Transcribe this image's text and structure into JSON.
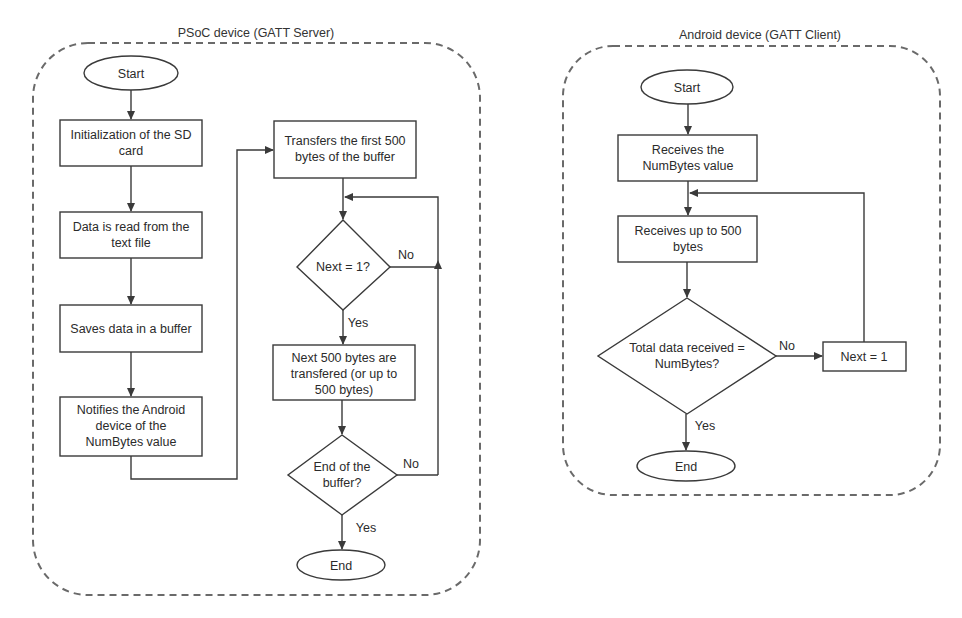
{
  "colors": {
    "background": "#ffffff",
    "stroke": "#3a3a3a",
    "container_border": "#6a6a6a",
    "text": "#2b2b2b"
  },
  "left_panel": {
    "title": "PSoC device (GATT Server)",
    "nodes": {
      "start": "Start",
      "init_sd": [
        "Initialization of the SD",
        "card"
      ],
      "read_data": [
        "Data is read from the",
        "text file"
      ],
      "save_buffer": [
        "Saves data in a buffer"
      ],
      "notify": [
        "Notifies the Android",
        "device of the",
        "NumBytes value"
      ],
      "transfer_first": [
        "Transfers the first 500",
        "bytes of the buffer"
      ],
      "decision_next": "Next = 1?",
      "transfer_next": [
        "Next 500 bytes are",
        "transfered (or up to",
        "500 bytes)"
      ],
      "decision_end": [
        "End of the",
        "buffer?"
      ],
      "end": "End"
    },
    "edge_labels": {
      "next_no": "No",
      "next_yes": "Yes",
      "end_no": "No",
      "end_yes": "Yes"
    }
  },
  "right_panel": {
    "title": "Android device (GATT Client)",
    "nodes": {
      "start": "Start",
      "receive_numbytes": [
        "Receives the",
        "NumBytes value"
      ],
      "receive_bytes": [
        "Receives up to 500",
        "bytes"
      ],
      "decision_total": [
        "Total data received =",
        "NumBytes?"
      ],
      "set_next": "Next = 1",
      "end": "End"
    },
    "edge_labels": {
      "total_no": "No",
      "total_yes": "Yes"
    }
  }
}
